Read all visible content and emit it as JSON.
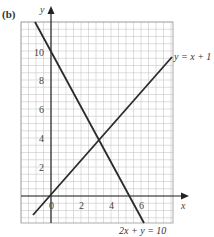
{
  "panel_label": "(b)",
  "chart_data": {
    "type": "line",
    "title": "",
    "xlabel": "x",
    "ylabel": "y",
    "xlim": [
      -2,
      8
    ],
    "ylim": [
      -2,
      12
    ],
    "x_ticks": [
      "0",
      "2",
      "4",
      "6"
    ],
    "y_ticks": [
      "2",
      "4",
      "6",
      "8",
      "10"
    ],
    "grid": true,
    "series": [
      {
        "name": "y = x + 1",
        "x": [
          -1.5,
          7.5
        ],
        "y": [
          -0.5,
          8.5
        ]
      },
      {
        "name": "2x + y = 10",
        "x": [
          -0.5,
          6
        ],
        "y": [
          11,
          -2
        ]
      }
    ],
    "intersection": {
      "x": 3,
      "y": 4
    },
    "annotations": [
      "y = x + 1",
      "2x + y = 10"
    ]
  },
  "labels": {
    "x_axis": "x",
    "y_axis": "y",
    "line1": "y = x + 1",
    "line2": "2x + y = 10",
    "origin": "0",
    "xt2": "2",
    "xt4": "4",
    "xt6": "6",
    "yt2": "2",
    "yt4": "4",
    "yt6": "6",
    "yt8": "8",
    "yt10": "10"
  },
  "colors": {
    "grid": "#bdbdbd",
    "line": "#2a2a2a"
  }
}
